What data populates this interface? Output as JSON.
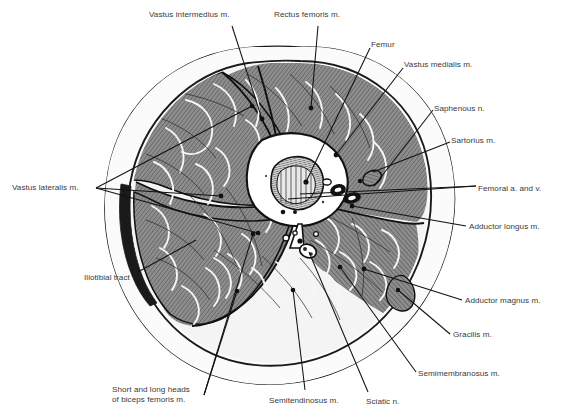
{
  "figure": {
    "type": "anatomical-cross-section",
    "background_color": "#ffffff",
    "ink_color": "#1a1a1a",
    "label_color": "#3a3a3a",
    "muscle_fill": "#8d8d8d",
    "fat_fill": "#f2f2f2",
    "bone_fill": "#ffffff"
  },
  "labels": [
    {
      "id": "vastus-intermedius",
      "text": "Vastus intermedius m.",
      "x": 149,
      "y": 10,
      "align": "left"
    },
    {
      "id": "rectus-femoris",
      "text": "Rectus femoris m.",
      "x": 274,
      "y": 10,
      "align": "left"
    },
    {
      "id": "femur",
      "text": "Femur",
      "x": 371,
      "y": 40,
      "align": "left"
    },
    {
      "id": "vastus-medialis",
      "text": "Vastus medialis m.",
      "x": 404,
      "y": 60,
      "align": "left"
    },
    {
      "id": "saphenous-nerve",
      "text": "Saphenous n.",
      "x": 434,
      "y": 104,
      "align": "left"
    },
    {
      "id": "sartorius",
      "text": "Sartorius m.",
      "x": 451,
      "y": 136,
      "align": "left"
    },
    {
      "id": "femoral-vessels",
      "text": "Femoral a. and v.",
      "x": 478,
      "y": 184,
      "align": "left"
    },
    {
      "id": "adductor-longus",
      "text": "Adductor longus m.",
      "x": 469,
      "y": 222,
      "align": "left"
    },
    {
      "id": "adductor-magnus",
      "text": "Adductor magnus m.",
      "x": 465,
      "y": 296,
      "align": "left"
    },
    {
      "id": "gracilis",
      "text": "Gracilis m.",
      "x": 453,
      "y": 330,
      "align": "left"
    },
    {
      "id": "semimembranosus",
      "text": "Semimembranosus m.",
      "x": 418,
      "y": 369,
      "align": "left"
    },
    {
      "id": "sciatic-nerve",
      "text": "Sciatic n.",
      "x": 366,
      "y": 397,
      "align": "left"
    },
    {
      "id": "semitendinosus",
      "text": "Semitendinosus m.",
      "x": 269,
      "y": 396,
      "align": "left"
    },
    {
      "id": "biceps-femoris",
      "text": "Short and long heads\nof biceps femoris m.",
      "x": 112,
      "y": 385,
      "align": "left"
    },
    {
      "id": "iliotibial-tract",
      "text": "Iliotibial tract",
      "x": 84,
      "y": 273,
      "align": "left"
    },
    {
      "id": "vastus-lateralis",
      "text": "Vastus lateralis m.",
      "x": 12,
      "y": 183,
      "align": "left"
    }
  ],
  "leaders": [
    {
      "id": "leader-vastus-intermedius",
      "points": "232,26 262,119"
    },
    {
      "id": "leader-rectus-femoris",
      "points": "318,26 311,108"
    },
    {
      "id": "leader-femur",
      "points": "370,48 306,182"
    },
    {
      "id": "leader-vastus-medialis",
      "points": "403,68 336,155"
    },
    {
      "id": "leader-saphenous-1",
      "points": "433,110 374,186"
    },
    {
      "id": "leader-sartorius",
      "points": "450,142 373,172"
    },
    {
      "id": "leader-femoral-a",
      "points": "476,186 288,199"
    },
    {
      "id": "leader-femoral-b",
      "points": "476,186 300,194"
    },
    {
      "id": "leader-adductor-longus",
      "points": "466,226 352,206"
    },
    {
      "id": "leader-adductor-magnus",
      "points": "462,300 364,269"
    },
    {
      "id": "leader-gracilis",
      "points": "450,334 398,290"
    },
    {
      "id": "leader-semimembranosus",
      "points": "416,372 340,267"
    },
    {
      "id": "leader-sciatic",
      "points": "368,392 309,252"
    },
    {
      "id": "leader-semitendinosus",
      "points": "305,390 293,290"
    },
    {
      "id": "leader-biceps-1",
      "points": "204,395 253,234"
    },
    {
      "id": "leader-biceps-2",
      "points": "204,395 237,291"
    },
    {
      "id": "leader-iliotibial",
      "points": "138,272 196,240"
    },
    {
      "id": "leader-vl-1",
      "points": "96,188 252,106"
    },
    {
      "id": "leader-vl-2",
      "points": "96,188 221,196"
    },
    {
      "id": "leader-vl-3",
      "points": "96,188 258,233"
    }
  ]
}
